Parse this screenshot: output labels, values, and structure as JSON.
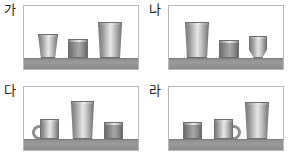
{
  "figure": {
    "type": "illustration-grid",
    "columns": 2,
    "rows": 2
  },
  "colors": {
    "background": "#ffffff",
    "frame_border": "#b9b9b9",
    "shelf": "#9a9a9a",
    "cup_light": "#e6e6e6",
    "cup_mid": "#9d9d9d",
    "cup_dark": "#6d6d6d",
    "label_text": "#1a1a1a"
  },
  "panels": [
    {
      "label": "가",
      "name": "panel-ga",
      "cups": [
        {
          "name": "cup-small-tapered",
          "shape": "tapered",
          "tone": "light",
          "handle": "none",
          "width": 20,
          "height": 24,
          "x": 14
        },
        {
          "name": "cup-medium-straight",
          "shape": "straight",
          "tone": "dark",
          "handle": "none",
          "width": 20,
          "height": 19,
          "x": 44
        },
        {
          "name": "cup-tall-tumbler",
          "shape": "tapered-soft",
          "tone": "light",
          "handle": "none",
          "width": 24,
          "height": 36,
          "x": 74
        }
      ]
    },
    {
      "label": "나",
      "name": "panel-na",
      "cups": [
        {
          "name": "cup-tall-tumbler",
          "shape": "tapered-soft",
          "tone": "light",
          "handle": "none",
          "width": 24,
          "height": 36,
          "x": 16
        },
        {
          "name": "cup-medium-straight",
          "shape": "straight",
          "tone": "dark",
          "handle": "none",
          "width": 20,
          "height": 18,
          "x": 50
        },
        {
          "name": "cup-goblet",
          "shape": "goblet",
          "tone": "light",
          "handle": "none",
          "width": 18,
          "height": 22,
          "x": 80
        }
      ]
    },
    {
      "label": "다",
      "name": "panel-da",
      "cups": [
        {
          "name": "cup-mug-handle-left",
          "shape": "straight",
          "tone": "light",
          "handle": "left",
          "width": 19,
          "height": 20,
          "x": 16
        },
        {
          "name": "cup-tall-tumbler",
          "shape": "tapered-soft",
          "tone": "light",
          "handle": "none",
          "width": 23,
          "height": 38,
          "x": 47
        },
        {
          "name": "cup-small-straight",
          "shape": "straight",
          "tone": "dark",
          "handle": "none",
          "width": 19,
          "height": 17,
          "x": 80
        }
      ]
    },
    {
      "label": "라",
      "name": "panel-ra",
      "cups": [
        {
          "name": "cup-small-straight",
          "shape": "straight",
          "tone": "dark",
          "handle": "none",
          "width": 19,
          "height": 17,
          "x": 14
        },
        {
          "name": "cup-mug-handle-right",
          "shape": "straight",
          "tone": "light",
          "handle": "right",
          "width": 19,
          "height": 20,
          "x": 45
        },
        {
          "name": "cup-tall-tumbler",
          "shape": "tapered-soft",
          "tone": "light",
          "handle": "none",
          "width": 24,
          "height": 37,
          "x": 76
        }
      ]
    }
  ]
}
